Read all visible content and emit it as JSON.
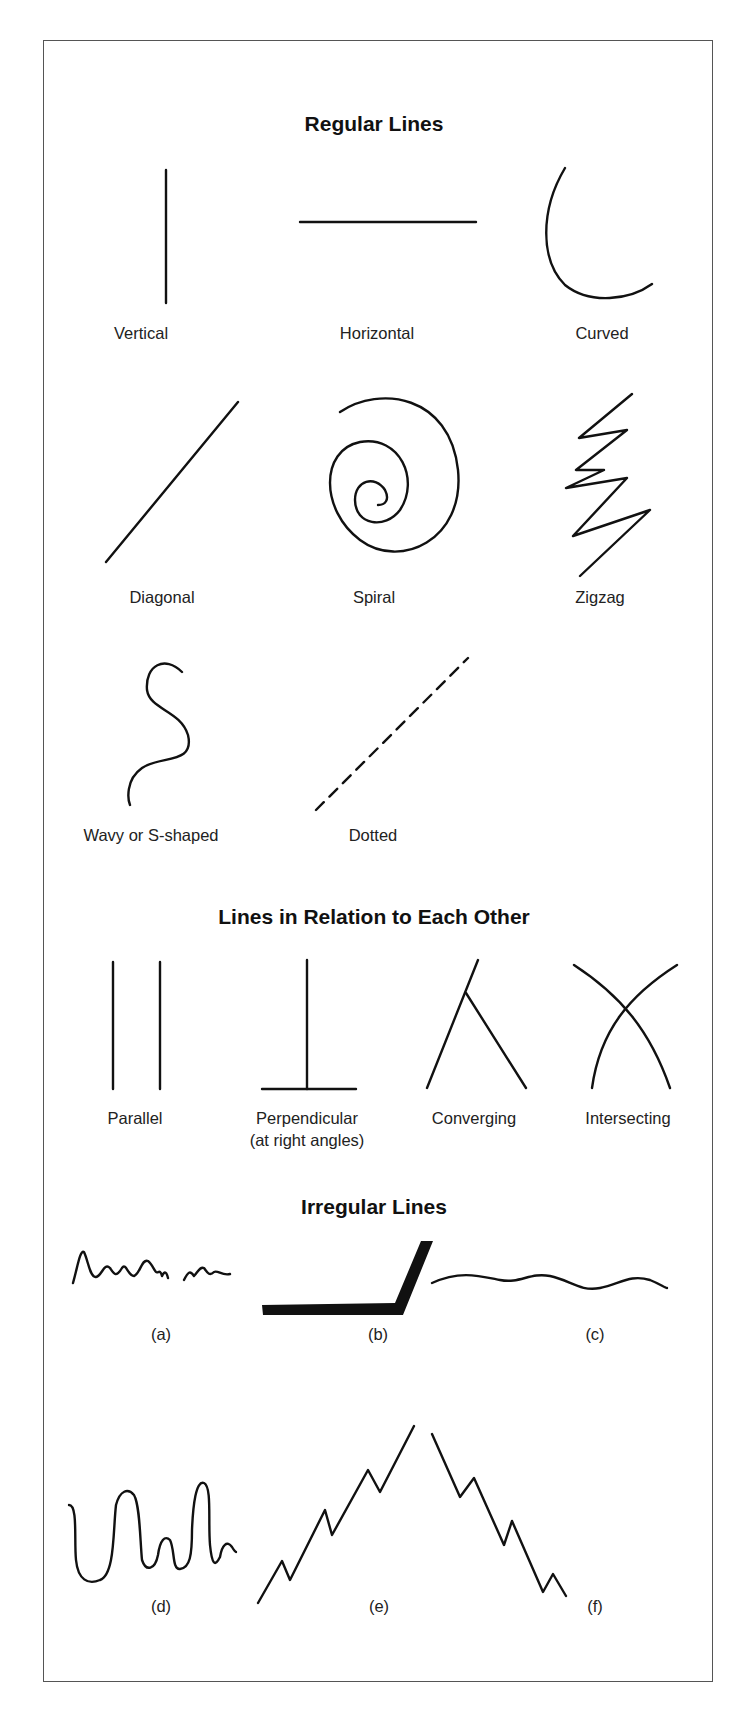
{
  "sections": {
    "regular": {
      "title": "Regular Lines",
      "items": [
        {
          "label": "Vertical"
        },
        {
          "label": "Horizontal"
        },
        {
          "label": "Curved"
        },
        {
          "label": "Diagonal"
        },
        {
          "label": "Spiral"
        },
        {
          "label": "Zigzag"
        },
        {
          "label": "Wavy or S-shaped"
        },
        {
          "label": "Dotted"
        }
      ]
    },
    "relation": {
      "title": "Lines in Relation to Each Other",
      "items": [
        {
          "label": "Parallel"
        },
        {
          "label": "Perpendicular",
          "sublabel": "(at right angles)"
        },
        {
          "label": "Converging"
        },
        {
          "label": "Intersecting"
        }
      ]
    },
    "irregular": {
      "title": "Irregular Lines",
      "items": [
        {
          "label": "(a)"
        },
        {
          "label": "(b)"
        },
        {
          "label": "(c)"
        },
        {
          "label": "(d)"
        },
        {
          "label": "(e)"
        },
        {
          "label": "(f)"
        }
      ]
    }
  }
}
